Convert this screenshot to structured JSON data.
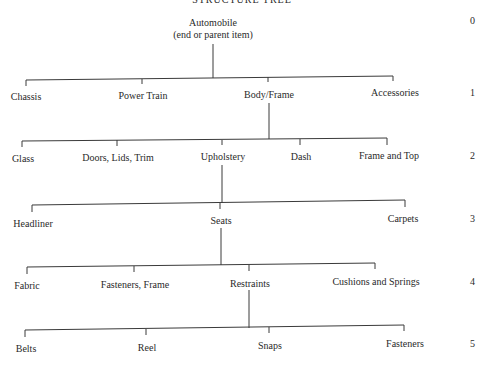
{
  "title": "STRUCTURE TREE",
  "root": {
    "label": "Automobile",
    "sublabel": "(end or parent item)",
    "level": "0"
  },
  "levels": [
    {
      "level": "1",
      "items": [
        "Chassis",
        "Power Train",
        "Body/Frame",
        "Accessories"
      ],
      "expanded": "Body/Frame"
    },
    {
      "level": "2",
      "items": [
        "Glass",
        "Doors, Lids, Trim",
        "Upholstery",
        "Dash",
        "Frame and Top"
      ],
      "expanded": "Upholstery"
    },
    {
      "level": "3",
      "items": [
        "Headliner",
        "Seats",
        "Carpets"
      ],
      "expanded": "Seats"
    },
    {
      "level": "4",
      "items": [
        "Fabric",
        "Fasteners, Frame",
        "Restraints",
        "Cushions and Springs"
      ],
      "expanded": "Restraints"
    },
    {
      "level": "5",
      "items": [
        "Belts",
        "Reel",
        "Snaps",
        "Fasteners"
      ]
    }
  ]
}
